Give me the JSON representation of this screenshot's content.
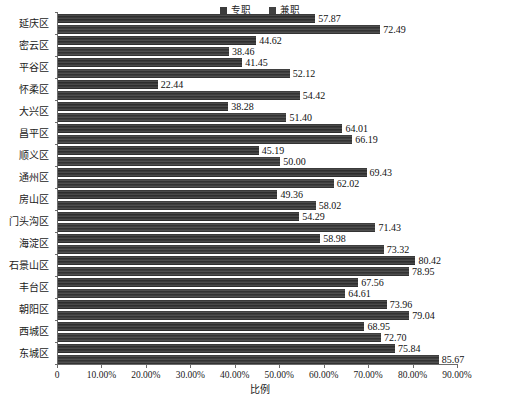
{
  "chart_data": {
    "type": "bar",
    "orientation": "horizontal",
    "title": "",
    "xlabel": "比例",
    "ylabel": "",
    "xlim": [
      0,
      90
    ],
    "xticks": [
      "0",
      "10.00%",
      "20.00%",
      "30.00%",
      "40.00%",
      "50.00%",
      "60.00%",
      "70.00%",
      "80.00%",
      "90.00%"
    ],
    "xtick_values": [
      0,
      10,
      20,
      30,
      40,
      50,
      60,
      70,
      80,
      90
    ],
    "grid": false,
    "legend_position": "top-center",
    "categories": [
      "延庆区",
      "密云区",
      "平谷区",
      "怀柔区",
      "大兴区",
      "昌平区",
      "顺义区",
      "通州区",
      "房山区",
      "门头沟区",
      "海淀区",
      "石景山区",
      "丰台区",
      "朝阳区",
      "西城区",
      "东城区"
    ],
    "series": [
      {
        "name": "专职",
        "color": "#3b3b3b",
        "values": [
          57.87,
          44.62,
          41.45,
          22.44,
          38.28,
          64.01,
          45.19,
          69.43,
          49.36,
          54.29,
          58.98,
          80.42,
          67.56,
          73.96,
          68.95,
          75.84
        ],
        "labels": [
          "57.87",
          "44.62",
          "41.45",
          "22.44",
          "38.28",
          "64.01",
          "45.19",
          "69.43",
          "49.36",
          "54.29",
          "58.98",
          "80.42",
          "67.56",
          "73.96",
          "68.95",
          "75.84"
        ]
      },
      {
        "name": "兼职",
        "color": "#414141",
        "values": [
          72.49,
          38.46,
          52.12,
          54.42,
          51.4,
          66.19,
          50.0,
          62.02,
          58.02,
          71.43,
          73.32,
          78.95,
          64.61,
          79.04,
          72.7,
          85.67
        ],
        "labels": [
          "72.49",
          "38.46",
          "52.12",
          "54.42",
          "51.40",
          "66.19",
          "50.00",
          "62.02",
          "58.02",
          "71.43",
          "73.32",
          "78.95",
          "64.61",
          "79.04",
          "72.70",
          "85.67"
        ]
      }
    ]
  }
}
